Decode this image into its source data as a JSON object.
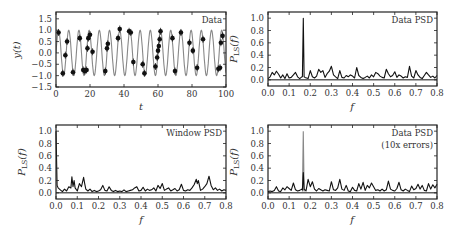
{
  "chart_data": [
    {
      "type": "scatter",
      "panel": "top-left",
      "title": "Data",
      "xlabel": "t",
      "ylabel": "y(t)",
      "xlim": [
        0,
        100
      ],
      "ylim": [
        -1.5,
        1.8
      ],
      "xticks": [
        "0",
        "20",
        "40",
        "60",
        "80",
        "100"
      ],
      "yticks": [
        "−1.5",
        "−1.0",
        "−0.5",
        "0.0",
        "0.5",
        "1.0",
        "1.5"
      ],
      "model_curve": {
        "name": "sinusoid",
        "amplitude": 1.0,
        "frequency": 0.1667,
        "color": "#888888"
      },
      "series": [
        {
          "name": "observations",
          "color": "#111111",
          "x": [
            1.5,
            4,
            5.5,
            6.5,
            10,
            14,
            16,
            17,
            18,
            18.5,
            19,
            20,
            21.5,
            29,
            30,
            30.5,
            36.5,
            37.5,
            43,
            44,
            45.5,
            51,
            52,
            58.5,
            59.5,
            60,
            60.5,
            61,
            61.5,
            68.5,
            70,
            73.5,
            78.5,
            80.5,
            83,
            86.5,
            95.5,
            96.5,
            97,
            98
          ],
          "y": [
            0.9,
            -0.9,
            -0.1,
            0.5,
            -0.85,
            0.65,
            -0.75,
            -0.8,
            -0.75,
            0.2,
            0.65,
            0.8,
            0.05,
            -0.8,
            0.2,
            0.4,
            0.65,
            1.05,
            0.95,
            0.9,
            -0.4,
            -0.5,
            -0.9,
            -0.6,
            -0.2,
            0.1,
            0.3,
            0.6,
            0.95,
            0.65,
            -0.8,
            0.9,
            0.45,
            0.1,
            -0.65,
            0.6,
            -0.7,
            -0.65,
            0.45,
            0.75
          ]
        }
      ]
    },
    {
      "type": "line",
      "panel": "top-right",
      "title": "Data PSD",
      "xlabel": "f",
      "ylabel": "P_LS(f)",
      "xlim": [
        0,
        0.8
      ],
      "ylim": [
        -0.1,
        1.1
      ],
      "xticks": [
        "0.0",
        "0.1",
        "0.2",
        "0.3",
        "0.4",
        "0.5",
        "0.6",
        "0.7",
        "0.8"
      ],
      "yticks": [
        "0.0",
        "0.2",
        "0.4",
        "0.6",
        "0.8",
        "1.0"
      ],
      "series": [
        {
          "name": "Data PSD",
          "color": "#111111",
          "peak": {
            "f": 0.167,
            "power": 1.0
          },
          "x": [
            0,
            0.01,
            0.02,
            0.03,
            0.04,
            0.05,
            0.06,
            0.07,
            0.08,
            0.09,
            0.1,
            0.11,
            0.12,
            0.13,
            0.14,
            0.15,
            0.16,
            0.167,
            0.175,
            0.19,
            0.2,
            0.21,
            0.22,
            0.23,
            0.24,
            0.25,
            0.26,
            0.27,
            0.28,
            0.29,
            0.3,
            0.31,
            0.32,
            0.33,
            0.34,
            0.35,
            0.36,
            0.37,
            0.38,
            0.39,
            0.4,
            0.41,
            0.42,
            0.43,
            0.44,
            0.45,
            0.46,
            0.47,
            0.48,
            0.49,
            0.5,
            0.51,
            0.52,
            0.53,
            0.54,
            0.55,
            0.56,
            0.57,
            0.58,
            0.59,
            0.6,
            0.61,
            0.62,
            0.63,
            0.64,
            0.65,
            0.66,
            0.67,
            0.68,
            0.69,
            0.7,
            0.71,
            0.72,
            0.73,
            0.74,
            0.75,
            0.76,
            0.77,
            0.78,
            0.79,
            0.8
          ],
          "y": [
            0.02,
            0.05,
            0.12,
            0.08,
            0.14,
            0.09,
            0.03,
            0.08,
            0.02,
            0.1,
            0.03,
            0.04,
            0.08,
            0.12,
            0.05,
            0.02,
            0.05,
            1.0,
            0.04,
            0.02,
            0.15,
            0.05,
            0.03,
            0.06,
            0.17,
            0.12,
            0.15,
            0.04,
            0.1,
            0.14,
            0.22,
            0.08,
            0.05,
            0.02,
            0.15,
            0.04,
            0.03,
            0.07,
            0.05,
            0.08,
            0.06,
            0.03,
            0.2,
            0.07,
            0.04,
            0.02,
            0.04,
            0.06,
            0.03,
            0.08,
            0.05,
            0.12,
            0.1,
            0.06,
            0.04,
            0.03,
            0.17,
            0.1,
            0.05,
            0.07,
            0.13,
            0.04,
            0.08,
            0.06,
            0.03,
            0.05,
            0.04,
            0.22,
            0.06,
            0.03,
            0.15,
            0.08,
            0.04,
            0.02,
            0.07,
            0.12,
            0.08,
            0.04,
            0.06,
            0.03,
            0.07
          ]
        }
      ]
    },
    {
      "type": "line",
      "panel": "bottom-left",
      "title": "Window PSD",
      "xlabel": "f",
      "ylabel": "P_LS(f)",
      "xlim": [
        0,
        0.8
      ],
      "ylim": [
        -0.1,
        1.1
      ],
      "xticks": [
        "0.0",
        "0.1",
        "0.2",
        "0.3",
        "0.4",
        "0.5",
        "0.6",
        "0.7",
        "0.8"
      ],
      "yticks": [
        "0.0",
        "0.2",
        "0.4",
        "0.6",
        "0.8",
        "1.0"
      ],
      "series": [
        {
          "name": "Window PSD",
          "color": "#111111",
          "x": [
            0,
            0.005,
            0.01,
            0.02,
            0.03,
            0.04,
            0.05,
            0.06,
            0.07,
            0.075,
            0.08,
            0.085,
            0.09,
            0.1,
            0.11,
            0.12,
            0.13,
            0.135,
            0.14,
            0.15,
            0.16,
            0.17,
            0.18,
            0.19,
            0.2,
            0.21,
            0.22,
            0.23,
            0.24,
            0.25,
            0.26,
            0.27,
            0.28,
            0.29,
            0.3,
            0.31,
            0.32,
            0.33,
            0.34,
            0.35,
            0.36,
            0.37,
            0.38,
            0.39,
            0.4,
            0.41,
            0.42,
            0.43,
            0.44,
            0.45,
            0.46,
            0.47,
            0.48,
            0.49,
            0.5,
            0.51,
            0.52,
            0.53,
            0.54,
            0.55,
            0.56,
            0.57,
            0.58,
            0.59,
            0.6,
            0.61,
            0.62,
            0.63,
            0.64,
            0.65,
            0.66,
            0.665,
            0.67,
            0.675,
            0.68,
            0.69,
            0.7,
            0.71,
            0.72,
            0.73,
            0.74,
            0.75,
            0.76,
            0.77,
            0.78,
            0.79,
            0.8
          ],
          "y": [
            1.0,
            0.12,
            0.08,
            0.05,
            0.02,
            0.06,
            0.03,
            0.1,
            0.08,
            0.26,
            0.1,
            0.2,
            0.08,
            0.03,
            0.15,
            0.1,
            0.25,
            0.15,
            0.06,
            0.03,
            0.06,
            0.02,
            0.04,
            0.02,
            0.03,
            0.05,
            0.12,
            0.04,
            0.03,
            0.1,
            0.04,
            0.02,
            0.04,
            0.02,
            0.03,
            0.02,
            0.05,
            0.02,
            0.03,
            0.04,
            0.05,
            0.08,
            0.1,
            0.03,
            0.04,
            0.09,
            0.03,
            0.06,
            0.04,
            0.05,
            0.08,
            0.03,
            0.12,
            0.07,
            0.15,
            0.04,
            0.06,
            0.08,
            0.03,
            0.05,
            0.07,
            0.03,
            0.05,
            0.14,
            0.04,
            0.03,
            0.05,
            0.04,
            0.08,
            0.13,
            0.22,
            0.15,
            0.2,
            0.12,
            0.04,
            0.06,
            0.1,
            0.15,
            0.27,
            0.12,
            0.05,
            0.08,
            0.04,
            0.06,
            0.03,
            0.05,
            0.04
          ]
        }
      ]
    },
    {
      "type": "line",
      "panel": "bottom-right",
      "title": "Data PSD\n(10x errors)",
      "xlabel": "f",
      "ylabel": "P_LS(f)",
      "xlim": [
        0,
        0.8
      ],
      "ylim": [
        -0.1,
        1.1
      ],
      "xticks": [
        "0.0",
        "0.1",
        "0.2",
        "0.3",
        "0.4",
        "0.5",
        "0.6",
        "0.7",
        "0.8"
      ],
      "yticks": [
        "0.0",
        "0.2",
        "0.4",
        "0.6",
        "0.8",
        "1.0"
      ],
      "series": [
        {
          "name": "Data PSD (reference)",
          "color": "#888888",
          "peak": {
            "f": 0.167,
            "power": 1.0
          }
        },
        {
          "name": "Data PSD (10x errors)",
          "color": "#111111",
          "peak": {
            "f": 0.167,
            "power": 0.33
          },
          "x": [
            0,
            0.01,
            0.02,
            0.03,
            0.04,
            0.05,
            0.06,
            0.07,
            0.08,
            0.09,
            0.1,
            0.11,
            0.12,
            0.13,
            0.14,
            0.15,
            0.16,
            0.167,
            0.175,
            0.18,
            0.19,
            0.2,
            0.21,
            0.22,
            0.23,
            0.24,
            0.25,
            0.26,
            0.27,
            0.28,
            0.29,
            0.3,
            0.31,
            0.32,
            0.33,
            0.34,
            0.35,
            0.36,
            0.37,
            0.38,
            0.39,
            0.4,
            0.41,
            0.42,
            0.43,
            0.44,
            0.45,
            0.46,
            0.47,
            0.48,
            0.49,
            0.5,
            0.51,
            0.52,
            0.53,
            0.54,
            0.55,
            0.56,
            0.57,
            0.58,
            0.59,
            0.6,
            0.61,
            0.62,
            0.63,
            0.64,
            0.65,
            0.66,
            0.67,
            0.68,
            0.69,
            0.7,
            0.71,
            0.72,
            0.73,
            0.74,
            0.75,
            0.76,
            0.77,
            0.78,
            0.79,
            0.8
          ],
          "y": [
            0.02,
            0.03,
            0.02,
            0.04,
            0.1,
            0.03,
            0.02,
            0.08,
            0.05,
            0.1,
            0.07,
            0.04,
            0.16,
            0.05,
            0.03,
            0.04,
            0.06,
            0.33,
            0.05,
            0.03,
            0.22,
            0.1,
            0.18,
            0.06,
            0.03,
            0.07,
            0.05,
            0.03,
            0.05,
            0.04,
            0.03,
            0.18,
            0.05,
            0.04,
            0.08,
            0.22,
            0.06,
            0.04,
            0.12,
            0.03,
            0.02,
            0.09,
            0.04,
            0.03,
            0.15,
            0.06,
            0.17,
            0.04,
            0.12,
            0.08,
            0.16,
            0.1,
            0.04,
            0.05,
            0.03,
            0.06,
            0.03,
            0.05,
            0.19,
            0.06,
            0.04,
            0.03,
            0.07,
            0.17,
            0.05,
            0.03,
            0.06,
            0.04,
            0.02,
            0.11,
            0.05,
            0.07,
            0.14,
            0.06,
            0.12,
            0.04,
            0.03,
            0.15,
            0.06,
            0.13,
            0.08,
            0.14
          ]
        }
      ]
    }
  ],
  "panels": {
    "top_left": {
      "title": "Data",
      "xlabel": "t",
      "ylabel": "y(t)"
    },
    "top_right": {
      "title": "Data PSD",
      "xlabel": "f",
      "ylabel": "P_LS(f)"
    },
    "bottom_left": {
      "title": "Window PSD",
      "xlabel": "f",
      "ylabel": "P_LS(f)"
    },
    "bottom_right": {
      "title_line1": "Data PSD",
      "title_line2": "(10x errors)",
      "xlabel": "f",
      "ylabel": "P_LS(f)"
    }
  }
}
